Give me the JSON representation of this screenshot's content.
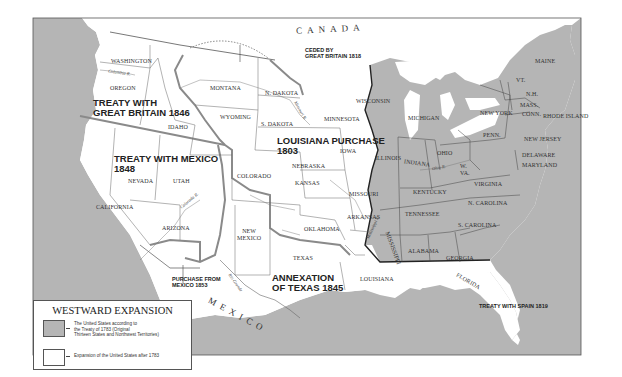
{
  "map": {
    "title": "WESTWARD EXPANSION",
    "colors": {
      "original_territory": "#b5b5b5",
      "expansion": "#ffffff",
      "water": "#b5b5b5",
      "border": "#555555",
      "acquisition_border": "#8a8a8a"
    },
    "countries": {
      "canada": "CANADA",
      "mexico": "MEXICO"
    },
    "acquisitions": {
      "great_britain_1846": "TREATY WITH\nGREAT BRITAIN 1846",
      "mexico_1848": "TREATY WITH MEXICO\n1848",
      "louisiana_1803": "LOUISIANA PURCHASE\n1803",
      "texas_1845": "ANNEXATION\nOF TEXAS 1845",
      "purchase_mexico_1853": "PURCHASE FROM\nMEXICO 1853",
      "ceded_britain_1818": "CEDED BY\nGREAT BRITAIN 1818",
      "spain_1819": "TREATY WITH SPAIN 1819"
    },
    "states": {
      "washington": "WASHINGTON",
      "oregon": "OREGON",
      "idaho": "IDAHO",
      "montana": "MONTANA",
      "wyoming": "WYOMING",
      "n_dakota": "N. DAKOTA",
      "s_dakota": "S. DAKOTA",
      "minnesota": "MINNESOTA",
      "iowa": "IOWA",
      "nebraska": "NEBRASKA",
      "kansas": "KANSAS",
      "colorado": "COLORADO",
      "utah": "UTAH",
      "nevada": "NEVADA",
      "california": "CALIFORNIA",
      "arizona": "ARIZONA",
      "new_mexico": "NEW\nMEXICO",
      "texas": "TEXAS",
      "oklahoma": "OKLAHOMA",
      "missouri": "MISSOURI",
      "arkansas": "ARKANSAS",
      "louisiana": "LOUISIANA",
      "wisconsin": "WISCONSIN",
      "michigan": "MICHIGAN",
      "illinois": "ILLINOIS",
      "indiana": "INDIANA",
      "ohio": "OHIO",
      "kentucky": "KENTUCKY",
      "tennessee": "TENNESSEE",
      "mississippi": "MISSISSIPPI",
      "alabama": "ALABAMA",
      "georgia": "GEORGIA",
      "florida": "FLORIDA",
      "s_carolina": "S. CAROLINA",
      "n_carolina": "N. CAROLINA",
      "virginia": "VIRGINIA",
      "w_va": "W.\nVA.",
      "penn": "PENN.",
      "new_york": "NEW YORK",
      "new_jersey": "NEW JERSEY",
      "delaware": "DELAWARE",
      "maryland": "MARYLAND",
      "maine": "MAINE",
      "vt": "VT.",
      "nh": "N.H.",
      "mass": "MASS.",
      "conn": "CONN.",
      "rhode_island": "RHODE ISLAND"
    },
    "rivers": {
      "columbia": "Columbia R.",
      "colorado": "Colorado R.",
      "missouri": "Missouri R.",
      "mississippi": "Mississippi R.",
      "ohio": "Ohio R.",
      "rio_grande": "Rio Grande"
    },
    "legend": {
      "title": "WESTWARD EXPANSION",
      "items": [
        {
          "label": "The United States according to\nthe Treaty of 1783 (Original\nThirteen States and Northwest Territories)",
          "color": "#b5b5b5"
        },
        {
          "label": "Expansion of the United States after 1783",
          "color": "#ffffff"
        }
      ]
    }
  }
}
